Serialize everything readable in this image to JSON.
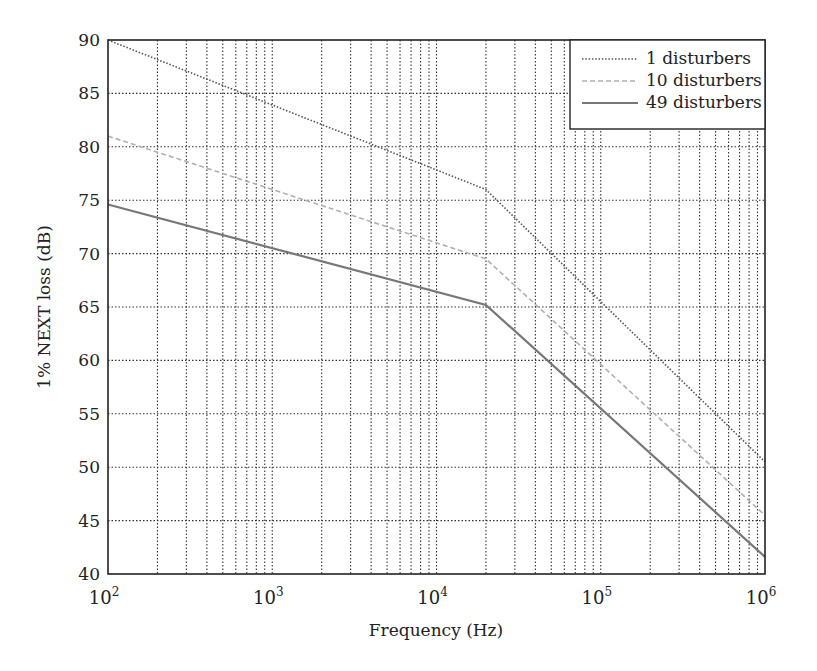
{
  "chart_data": {
    "type": "line",
    "title": "",
    "xlabel": "Frequency (Hz)",
    "ylabel": "1% NEXT loss (dB)",
    "xscale": "log",
    "xlim": [
      100,
      1000000
    ],
    "ylim": [
      40,
      90
    ],
    "x_ticks": [
      {
        "base": "10",
        "exp": "2"
      },
      {
        "base": "10",
        "exp": "3"
      },
      {
        "base": "10",
        "exp": "4"
      },
      {
        "base": "10",
        "exp": "5"
      },
      {
        "base": "10",
        "exp": "6"
      }
    ],
    "y_ticks": [
      "40",
      "45",
      "50",
      "55",
      "60",
      "65",
      "70",
      "75",
      "80",
      "85",
      "90"
    ],
    "grid": true,
    "legend_position": "upper right",
    "series": [
      {
        "name": "1 disturbers",
        "style": "dotted",
        "color": "#555555",
        "x": [
          100,
          20000,
          1000000
        ],
        "y": [
          90.0,
          76.0,
          50.5
        ]
      },
      {
        "name": "10 disturbers",
        "style": "dashed",
        "color": "#b0b0b0",
        "x": [
          100,
          20000,
          1000000
        ],
        "y": [
          81.0,
          69.5,
          45.5
        ]
      },
      {
        "name": "49 disturbers",
        "style": "solid",
        "color": "#777777",
        "x": [
          100,
          20000,
          1000000
        ],
        "y": [
          74.6,
          65.2,
          41.6
        ]
      }
    ]
  }
}
